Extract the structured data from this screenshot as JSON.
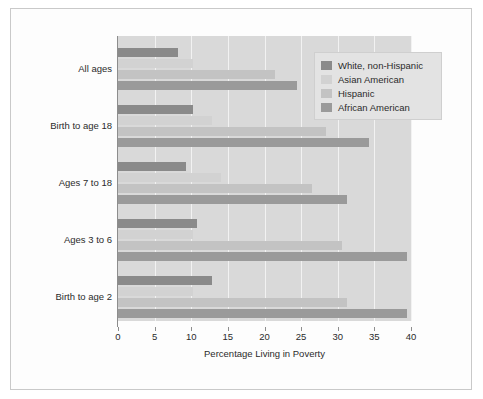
{
  "chart_data": {
    "type": "bar",
    "orientation": "horizontal",
    "title": "",
    "xlabel": "Percentage Living in Poverty",
    "ylabel": "",
    "xlim": [
      0,
      40
    ],
    "xticks": [
      0,
      5,
      10,
      15,
      20,
      25,
      30,
      35,
      40
    ],
    "grid": true,
    "legend_position": "top-right",
    "categories": [
      "All ages",
      "Birth to age 18",
      "Ages 7 to 18",
      "Ages 3 to 6",
      "Birth to age 2"
    ],
    "series": [
      {
        "name": "White, non-Hispanic",
        "color": "#8a8a8a",
        "values": [
          8.2,
          10.3,
          9.3,
          10.8,
          12.8
        ]
      },
      {
        "name": "Asian American",
        "color": "#d2d2d2",
        "values": [
          10.3,
          12.8,
          14.0,
          10.3,
          10.3
        ]
      },
      {
        "name": "Hispanic",
        "color": "#c3c3c3",
        "values": [
          21.4,
          28.4,
          26.5,
          30.6,
          31.3
        ]
      },
      {
        "name": "African American",
        "color": "#9a9a9a",
        "values": [
          24.5,
          34.2,
          31.3,
          39.4,
          39.5
        ]
      }
    ]
  },
  "legend": {
    "items": [
      {
        "label": "White, non-Hispanic",
        "color": "#8a8a8a"
      },
      {
        "label": "Asian American",
        "color": "#d2d2d2"
      },
      {
        "label": "Hispanic",
        "color": "#c3c3c3"
      },
      {
        "label": "African American",
        "color": "#9a9a9a"
      }
    ]
  },
  "axis": {
    "x_title": "Percentage Living in Poverty",
    "tick_labels": [
      "0",
      "5",
      "10",
      "15",
      "20",
      "25",
      "30",
      "35",
      "40"
    ]
  },
  "categories": [
    "All ages",
    "Birth to age 18",
    "Ages 7 to 18",
    "Ages 3 to 6",
    "Birth to age 2"
  ],
  "colors": {
    "plot_background": "#d9d9d9",
    "figure_background": "#fdfdfd",
    "gridline": "#f2f2f2",
    "axis": "#8d8d8d",
    "text": "#2b2b2b",
    "legend_background": "#e3e3e3"
  }
}
